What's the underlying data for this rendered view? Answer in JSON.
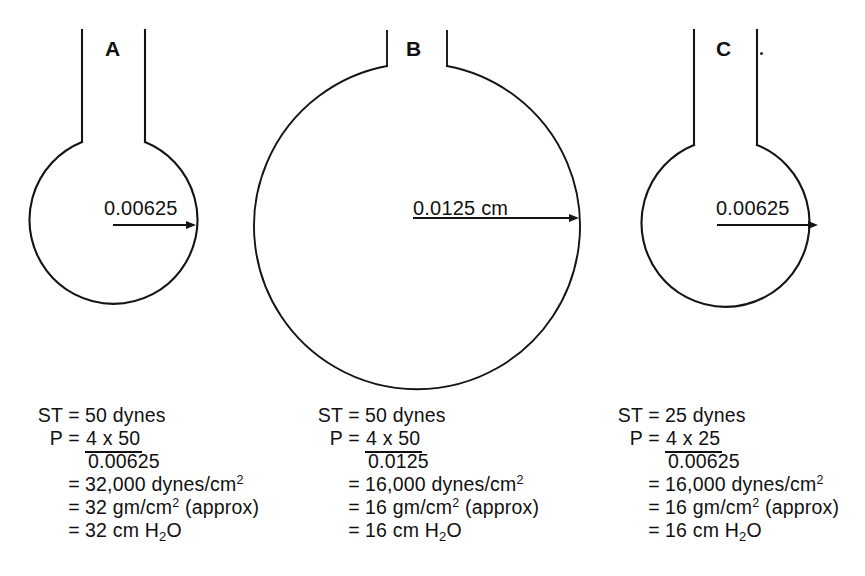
{
  "figure": {
    "type": "diagram",
    "background_color": "#ffffff",
    "ink_color": "#141414"
  },
  "panels": [
    {
      "letter": "A",
      "radius_label": "0.00625",
      "radius_units_shown": false,
      "shape": "sphere-with-neck",
      "sphere": {
        "cx": 113,
        "cy": 225,
        "r": 84
      },
      "neck": {
        "left_x": 82,
        "right_x": 145,
        "top_y": 30,
        "bottom_y": 142
      },
      "radius_arrow": {
        "x1": 113,
        "x2": 196,
        "y": 225
      },
      "calc": {
        "st_label": "ST",
        "st_value": "50 dynes",
        "p_label": "P",
        "numerator": "4 x 50",
        "denominator": "0.00625",
        "result_dynes": "32,000 dynes/cm",
        "result_dynes_exp": "2",
        "result_gm": "32 gm/cm",
        "result_gm_exp": "2",
        "result_gm_note": "(approx)",
        "result_cmh2o_pre": "32 cm H",
        "result_cmh2o_sub": "2",
        "result_cmh2o_post": "O"
      }
    },
    {
      "letter": "B",
      "radius_label": "0.0125 cm",
      "radius_units_shown": true,
      "shape": "sphere-with-neck",
      "sphere": {
        "cx": 415,
        "cy": 227,
        "r": 163
      },
      "neck": {
        "left_x": 387,
        "right_x": 447,
        "top_y": 31,
        "bottom_y": 66
      },
      "radius_arrow": {
        "x1": 413,
        "x2": 578,
        "y": 218
      },
      "calc": {
        "st_label": "ST",
        "st_value": "50 dynes",
        "p_label": "P",
        "numerator": "4 x 50",
        "denominator": "0.0125",
        "result_dynes": "16,000 dynes/cm",
        "result_dynes_exp": "2",
        "result_gm": "16 gm/cm",
        "result_gm_exp": "2",
        "result_gm_note": "(approx)",
        "result_cmh2o_pre": "16 cm H",
        "result_cmh2o_sub": "2",
        "result_cmh2o_post": "O"
      }
    },
    {
      "letter": "C",
      "radius_label": "0.00625",
      "radius_units_shown": false,
      "shape": "sphere-with-neck",
      "sphere": {
        "cx": 735,
        "cy": 228,
        "r": 84
      },
      "neck": {
        "left_x": 694,
        "right_x": 757,
        "top_y": 30,
        "bottom_y": 145
      },
      "radius_arrow": {
        "x1": 717,
        "x2": 818,
        "y": 225
      },
      "calc": {
        "st_label": "ST",
        "st_value": "25 dynes",
        "p_label": "P",
        "numerator": "4 x 25",
        "denominator": "0.00625",
        "result_dynes": "16,000 dynes/cm",
        "result_dynes_exp": "2",
        "result_gm": "16 gm/cm",
        "result_gm_exp": "2",
        "result_gm_note": "(approx)",
        "result_cmh2o_pre": "16 cm H",
        "result_cmh2o_sub": "2",
        "result_cmh2o_post": "O"
      }
    }
  ],
  "equals_sign": "=",
  "blank": ""
}
